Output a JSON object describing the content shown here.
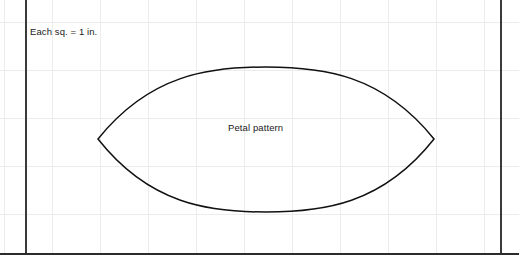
{
  "figure": {
    "kind": "grid-paper-diagram",
    "scale_note": "Each sq. = 1 in.",
    "shape_label": "Petal pattern",
    "colors": {
      "paper": "#ffffff",
      "grid_line": "#ececec",
      "heavy_rule": "#2b2b2b",
      "shape_stroke": "#111111",
      "text": "#1a1a1a"
    },
    "grid": {
      "square_size_px": 48,
      "square_value": "1 in.",
      "origin_x_px": 4,
      "origin_y_px": 22
    },
    "border_rules": {
      "left_x_px": 25,
      "right_x_px": 500,
      "bottom_y_px": 253
    },
    "shape": {
      "name": "petal",
      "type": "vesica-piscis",
      "left_vertex": [
        98,
        139
      ],
      "right_vertex": [
        434,
        139
      ],
      "top_apex": [
        266,
        67
      ],
      "bottom_apex": [
        266,
        212
      ],
      "width_px": 336,
      "height_px": 145,
      "width_in": 7,
      "height_in": 3,
      "path": "M 98 139 C 150 74, 210 67, 266 67 C 322 67, 382 74, 434 139 C 382 205, 322 212, 266 212 C 210 212, 150 205, 98 139 Z"
    }
  }
}
